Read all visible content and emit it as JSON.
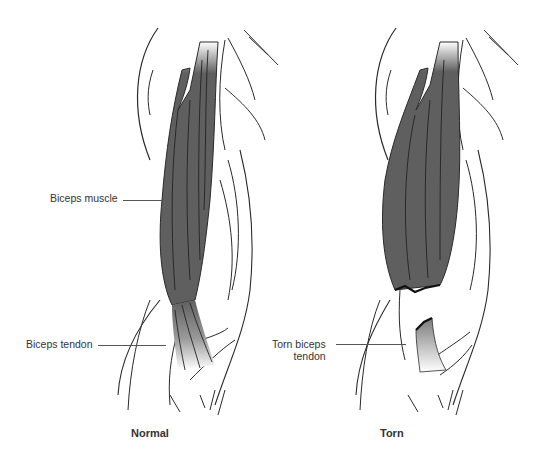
{
  "figure": {
    "panels": [
      {
        "id": "normal",
        "caption": "Normal",
        "labels": [
          {
            "text": "Biceps muscle"
          },
          {
            "text": "Biceps tendon"
          }
        ]
      },
      {
        "id": "torn",
        "caption": "Torn",
        "labels": [
          {
            "text_line1": "Torn biceps",
            "text_line2": "tendon"
          }
        ]
      }
    ],
    "colors": {
      "muscle_fill": "#5f5f5f",
      "line": "#2a2a2a",
      "text": "#333333",
      "background": "#ffffff"
    }
  }
}
